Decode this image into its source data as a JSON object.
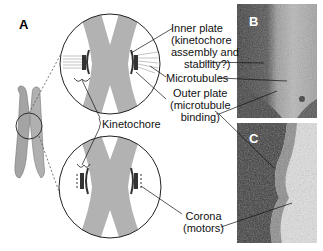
{
  "figure": {
    "panels": [
      {
        "id": "A",
        "label": "A",
        "description": "Schematic of chromosome with two magnified kinetochore views"
      },
      {
        "id": "B",
        "label": "B",
        "description": "Electron micrograph of kinetochore with microtubules"
      },
      {
        "id": "C",
        "label": "C",
        "description": "Electron micrograph of kinetochore showing corona"
      }
    ],
    "annotations": {
      "inner_plate": [
        "Inner plate",
        "(kinetochore",
        "assembly and",
        "stability?)"
      ],
      "microtubules": "Microtubules",
      "outer_plate": [
        "Outer plate",
        "(microtubule",
        "binding)"
      ],
      "kinetochore": "Kinetochore",
      "corona": [
        "Corona",
        "(motors)"
      ]
    },
    "colors": {
      "chromosome": "#a8a8a8",
      "kinetochore_plate": "#444444",
      "micrograph_dark": "#3a3a3a",
      "micrograph_light": "#d0d0d0",
      "text": "#111111"
    }
  }
}
